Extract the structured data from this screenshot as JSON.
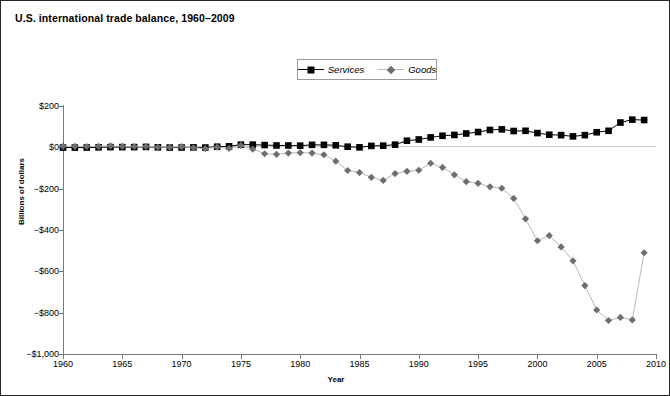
{
  "chart_data": {
    "type": "line",
    "title": "U.S. international trade balance, 1960–2009",
    "xlabel": "Year",
    "ylabel": "Billions of dollars",
    "xlim": [
      1960,
      2010
    ],
    "ylim": [
      -1000,
      200
    ],
    "grid": false,
    "legend_position": "top-center",
    "ytick_labels": [
      "$200",
      "$0",
      "−$200",
      "−$400",
      "−$600",
      "−$800",
      "−$1,000"
    ],
    "ytick_values": [
      200,
      0,
      -200,
      -400,
      -600,
      -800,
      -1000
    ],
    "xtick_labels": [
      "1960",
      "1965",
      "1970",
      "1975",
      "1980",
      "1985",
      "1990",
      "1995",
      "2000",
      "2005",
      "2010"
    ],
    "xtick_values": [
      1960,
      1965,
      1970,
      1975,
      1980,
      1985,
      1990,
      1995,
      2000,
      2005,
      2010
    ],
    "x": [
      1960,
      1961,
      1962,
      1963,
      1964,
      1965,
      1966,
      1967,
      1968,
      1969,
      1970,
      1971,
      1972,
      1973,
      1974,
      1975,
      1976,
      1977,
      1978,
      1979,
      1980,
      1981,
      1982,
      1983,
      1984,
      1985,
      1986,
      1987,
      1988,
      1989,
      1990,
      1991,
      1992,
      1993,
      1994,
      1995,
      1996,
      1997,
      1998,
      1999,
      2000,
      2001,
      2002,
      2003,
      2004,
      2005,
      2006,
      2007,
      2008,
      2009
    ],
    "series": [
      {
        "name": "Services",
        "marker": "square",
        "color": "#000000",
        "line_color": "#000000",
        "values": [
          -1,
          -1,
          -1,
          0,
          1,
          1,
          1,
          2,
          0,
          -1,
          -1,
          0,
          -1,
          3,
          5,
          13,
          13,
          11,
          9,
          9,
          8,
          12,
          12,
          10,
          3,
          0,
          7,
          8,
          13,
          32,
          38,
          48,
          56,
          60,
          67,
          74,
          84,
          87,
          79,
          80,
          69,
          61,
          59,
          53,
          59,
          73,
          80,
          120,
          134,
          132
        ]
      },
      {
        "name": "Goods",
        "marker": "diamond",
        "color": "#6e6e6e",
        "line_color": "#b8b8b8",
        "values": [
          5,
          5,
          4,
          5,
          7,
          5,
          4,
          4,
          1,
          1,
          3,
          -2,
          -6,
          1,
          -5,
          9,
          -9,
          -31,
          -34,
          -28,
          -26,
          -28,
          -36,
          -67,
          -112,
          -122,
          -145,
          -160,
          -127,
          -116,
          -111,
          -77,
          -97,
          -133,
          -166,
          -174,
          -191,
          -198,
          -247,
          -346,
          -452,
          -427,
          -482,
          -549,
          -669,
          -787,
          -838,
          -823,
          -835,
          -510
        ]
      }
    ],
    "legend_entries": [
      {
        "label": "Services",
        "marker": "square",
        "color": "#000000"
      },
      {
        "label": "Goods",
        "marker": "diamond",
        "color": "#6e6e6e"
      }
    ]
  }
}
